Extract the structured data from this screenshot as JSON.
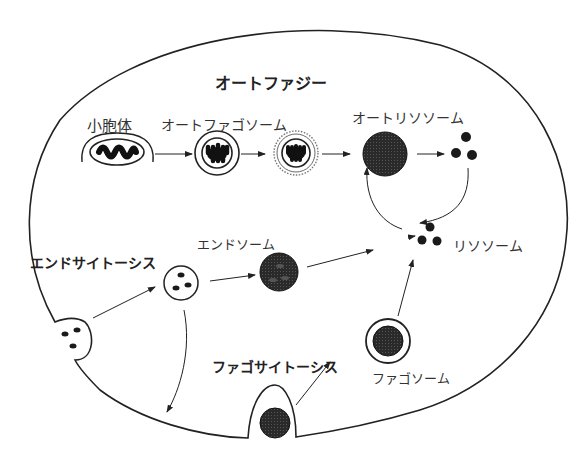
{
  "diagram": {
    "title": "オートファジー",
    "labels": {
      "organelle": "小胞体",
      "autophagosome": "オートファゴソーム",
      "autolysosome": "オートリソソーム",
      "lysosome": "リソソーム",
      "endocytosis": "エンドサイトーシス",
      "endosome": "エンドソーム",
      "phagocytosis": "ファゴサイトーシス",
      "phagosome": "ファゴソーム"
    },
    "colors": {
      "stroke": "#222222",
      "fill_dark": "#1a1a1a",
      "fill_endosome": "#333333",
      "background": "#ffffff"
    },
    "flows": [
      {
        "from": "小胞体",
        "to": "オートファゴソーム"
      },
      {
        "from": "オートファゴソーム",
        "to": "オートファゴソーム(二重膜)"
      },
      {
        "from": "オートファゴソーム(二重膜)",
        "to": "オートリソソーム"
      },
      {
        "from": "オートリソソーム",
        "to": "分解産物"
      },
      {
        "from": "分解産物",
        "to": "リソソーム"
      },
      {
        "from": "リソソーム",
        "to": "オートリソソーム"
      },
      {
        "from": "エンドサイトーシス",
        "to": "初期エンドソーム"
      },
      {
        "from": "初期エンドソーム",
        "to": "エンドソーム"
      },
      {
        "from": "初期エンドソーム",
        "to": "細胞膜"
      },
      {
        "from": "エンドソーム",
        "to": "リソソーム"
      },
      {
        "from": "ファゴサイトーシス",
        "to": "ファゴソーム"
      },
      {
        "from": "ファゴソーム",
        "to": "リソソーム"
      }
    ]
  }
}
